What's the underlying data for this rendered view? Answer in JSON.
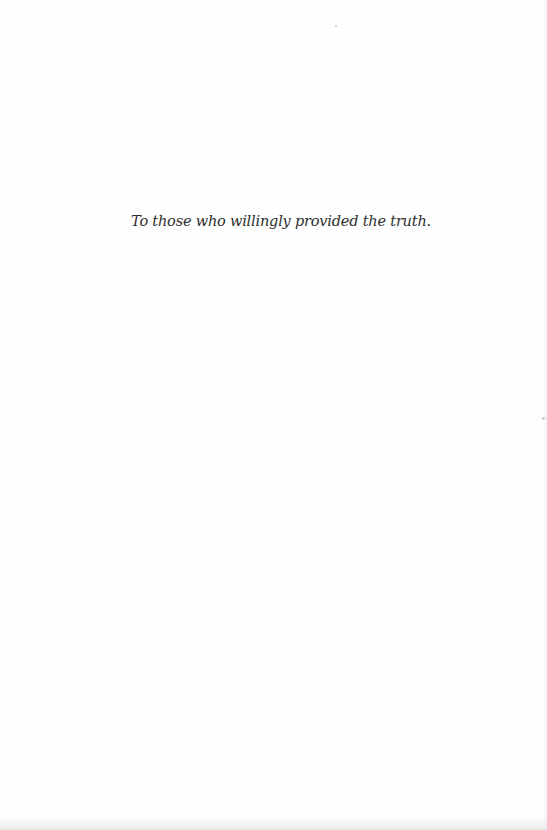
{
  "page": {
    "dedication": "To those who willingly provided the truth."
  }
}
